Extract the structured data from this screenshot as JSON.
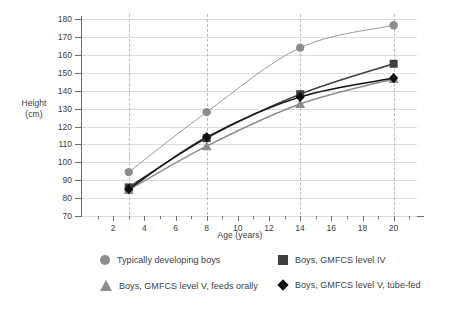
{
  "chart_data": {
    "type": "line",
    "title": "",
    "xlabel": "Age (years)",
    "ylabel": "Height (cm)",
    "ylabel_line1": "Height",
    "ylabel_line2": "(cm)",
    "x": [
      3,
      8,
      14,
      20
    ],
    "xlim": [
      0,
      21.5
    ],
    "ylim": [
      70,
      180
    ],
    "xticks": [
      2,
      4,
      6,
      8,
      10,
      12,
      14,
      16,
      18,
      20
    ],
    "xticks_minor": [
      1,
      3,
      5,
      7,
      9,
      11,
      13,
      15,
      17,
      19,
      21
    ],
    "yticks": [
      70,
      80,
      90,
      100,
      110,
      120,
      130,
      140,
      150,
      160,
      170,
      180
    ],
    "grid": "horizontal-solid-and-vertical-dashed-at-data-ages",
    "vertical_gridlines_at": [
      3,
      8,
      14,
      20
    ],
    "legend_position": "bottom",
    "series": [
      {
        "name": "Typically developing boys",
        "marker": "circle",
        "color": "#8c8c8c",
        "values": [
          94.5,
          128,
          164,
          176.5
        ]
      },
      {
        "name": "Boys, GMFCS level IV",
        "marker": "square",
        "color": "#3f3f3f",
        "values": [
          86,
          113.5,
          138,
          155
        ]
      },
      {
        "name": "Boys, GMFCS level V, feeds orally",
        "marker": "triangle",
        "color": "#8c8c8c",
        "values": [
          84.5,
          109,
          132.5,
          146.5
        ]
      },
      {
        "name": "Boys, GMFCS level V, tube-fed",
        "marker": "diamond",
        "color": "#111111",
        "values": [
          85,
          114,
          136.5,
          147
        ]
      }
    ]
  },
  "axes": {
    "x_title": "Age (years)",
    "y_title_line1": "Height",
    "y_title_line2": "(cm)",
    "y_tick_labels": [
      "180",
      "170",
      "160",
      "150",
      "140",
      "130",
      "120",
      "110",
      "100",
      "90",
      "80",
      "70"
    ],
    "x_tick_labels": [
      "2",
      "4",
      "6",
      "8",
      "10",
      "12",
      "14",
      "16",
      "18",
      "20"
    ]
  },
  "legend": {
    "items": [
      {
        "marker": "circle-marker",
        "label": "Typically developing boys"
      },
      {
        "marker": "square-marker",
        "label": "Boys, GMFCS level IV"
      },
      {
        "marker": "triangle-marker",
        "label": "Boys, GMFCS level V, feeds orally"
      },
      {
        "marker": "diamond-marker",
        "label": "Boys, GMFCS level V, tube-fed"
      }
    ]
  },
  "colors": {
    "grey_series": "#8c8c8c",
    "dark_grey_series": "#3f3f3f",
    "black_series": "#111111",
    "gridline": "#dcdcdc",
    "axis": "#6b6b6b",
    "text": "#3d3d3d",
    "background": "#ffffff"
  }
}
